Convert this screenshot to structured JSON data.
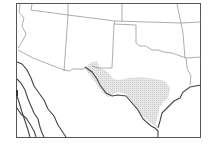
{
  "map": {
    "description": "Range map of southwestern United States and northern Mexico with shaded distribution over central Texas",
    "colors": {
      "background": "#ffffff",
      "frame": "#555555",
      "state_borders": "#777777",
      "coastline": "#444444",
      "range_fill": "#dcdcdc"
    },
    "regions": [
      {
        "name": "Arizona"
      },
      {
        "name": "New Mexico"
      },
      {
        "name": "Texas"
      },
      {
        "name": "Oklahoma"
      },
      {
        "name": "Kansas"
      },
      {
        "name": "Colorado"
      },
      {
        "name": "Arkansas"
      },
      {
        "name": "Louisiana"
      },
      {
        "name": "Mexico"
      }
    ],
    "range_area": {
      "label": "Shaded distribution range",
      "location": "Central Texas"
    }
  }
}
